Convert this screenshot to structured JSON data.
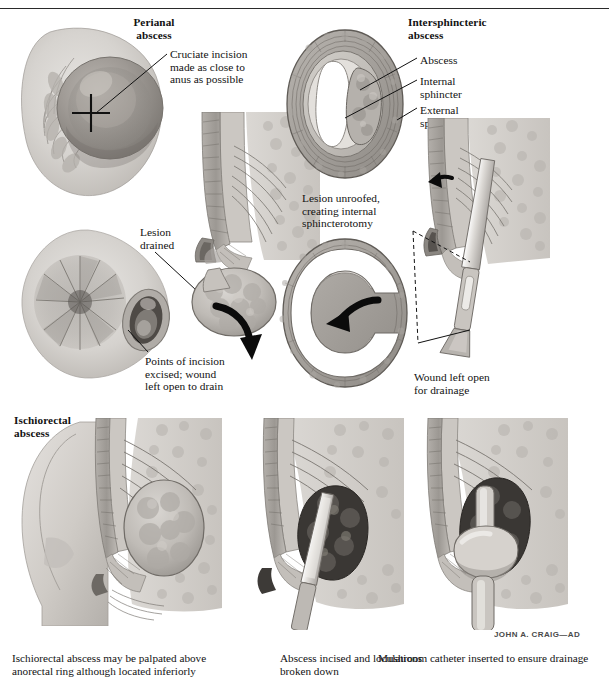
{
  "plate": {
    "background": "#ffffff",
    "ink": "#121212",
    "artist_signature": "JOHN A. CRAIG—AD"
  },
  "figures": {
    "perianal": {
      "heading": "Perianal\nabscess",
      "callout": "Cruciate incision\nmade as close to\nanus as possible",
      "incision_marker": "cruciate-incision-cross"
    },
    "perianal_drained": {
      "callout_lesion": "Lesion\ndrained",
      "callout_points": "Points of incision\nexcised; wound\nleft open to drain"
    },
    "intersphincteric": {
      "heading": "Intersphincteric\nabscess",
      "labels": [
        "Abscess",
        "Internal\nsphincter",
        "External\nsphincter"
      ],
      "unroofed_caption": "Lesion unroofed,\ncreating internal\nsphincterotomy",
      "wound_caption": "Wound left open\nfor drainage"
    },
    "ischiorectal": {
      "heading": "Ischiorectal\nabscess",
      "captions": [
        "Ischiorectal abscess may be palpated above\nanorectal ring although located inferiorly",
        "Abscess incised and loculations\nbroken down",
        "Mushroom catheter inserted to ensure drainage"
      ]
    }
  }
}
